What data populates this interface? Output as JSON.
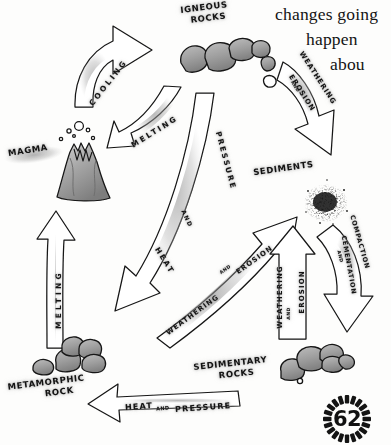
{
  "page": {
    "number": "62",
    "background_color": "#fdfdfc",
    "ink_color": "#141414",
    "rock_fill_color": "#9a9a9a"
  },
  "body_text": {
    "line1": "changes going",
    "line2": "happen",
    "line3": "abou"
  },
  "diagram": {
    "stages": [
      {
        "id": "igneous-rocks",
        "label_line1": "IGNEOUS",
        "label_line2": "ROCKS",
        "icon": "rock-cluster-icon"
      },
      {
        "id": "sediments",
        "label_line1": "SEDIMENTS",
        "label_line2": "",
        "icon": "sediment-speckle-icon"
      },
      {
        "id": "sedimentary-rocks",
        "label_line1": "SEDIMENTARY",
        "label_line2": "ROCKS",
        "icon": "rock-cluster-icon"
      },
      {
        "id": "metamorphic-rock",
        "label_line1": "METAMORPHIC",
        "label_line2": "ROCK",
        "icon": "rock-cluster-icon"
      },
      {
        "id": "magma",
        "label_line1": "MAGMA",
        "label_line2": "",
        "icon": "volcano-icon"
      }
    ],
    "arrows": [
      {
        "id": "cooling",
        "label": "COOLING",
        "from": "magma",
        "to": "igneous-rocks",
        "direction": "up-right"
      },
      {
        "id": "melting-top",
        "label": "MELTING",
        "from": "igneous-rocks",
        "to": "magma",
        "direction": "down-left"
      },
      {
        "id": "weathering-erosion-top",
        "label": "WEATHERING AND EROSION",
        "from": "igneous-rocks",
        "to": "sediments",
        "direction": "down-right"
      },
      {
        "id": "heat-and-pressure-center",
        "label": "HEAT AND PRESSURE",
        "from": "igneous-rocks",
        "to": "metamorphic-rock",
        "direction": "down-left"
      },
      {
        "id": "weathering-erosion-diagonal",
        "label": "WEATHERING AND EROSION",
        "from": "metamorphic-rock",
        "to": "sediments",
        "direction": "up-right"
      },
      {
        "id": "weathering-erosion-right",
        "label": "WEATHERING AND EROSION",
        "from": "sedimentary-rocks",
        "to": "sediments",
        "direction": "up"
      },
      {
        "id": "compaction-cementation",
        "label": "COMPACTION AND CEMENTATION",
        "from": "sediments",
        "to": "sedimentary-rocks",
        "direction": "down"
      },
      {
        "id": "heat-and-pressure-bottom",
        "label": "HEAT AND PRESSURE",
        "from": "sedimentary-rocks",
        "to": "metamorphic-rock",
        "direction": "left"
      },
      {
        "id": "melting-left",
        "label": "MELTING",
        "from": "metamorphic-rock",
        "to": "magma",
        "direction": "up"
      }
    ],
    "arrow_label_words": {
      "weathering": "WEATHERING",
      "erosion": "EROSION",
      "and_small": "AND",
      "heat": "HEAT",
      "pressure": "PRESSURE",
      "compaction": "COMPACTION",
      "cementation": "CEMENTATION",
      "cooling": "COOLING",
      "melting": "MELTING"
    }
  }
}
